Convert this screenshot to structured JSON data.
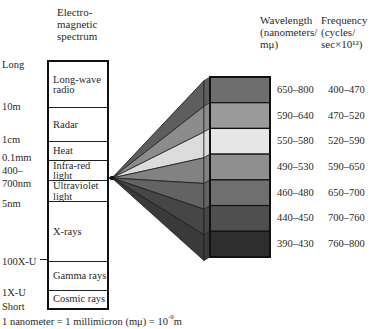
{
  "header": {
    "spectrum_title": [
      "Electro-",
      "magnetic",
      "spectrum"
    ],
    "wavelength_title": [
      "Wavelength",
      "(nanometers/",
      "mμ)"
    ],
    "frequency_title": [
      "Frequency",
      "(cycles/",
      "sec×10¹²)"
    ]
  },
  "scale_labels": [
    {
      "text": "Long",
      "y": 59
    },
    {
      "text": "10m",
      "y": 101
    },
    {
      "text": "1cm",
      "y": 134
    },
    {
      "text": "0.1mm",
      "y": 152
    },
    {
      "text": "400–",
      "y": 165
    },
    {
      "text": "700nm",
      "y": 178
    },
    {
      "text": "5nm",
      "y": 198
    },
    {
      "text": "100X-U",
      "y": 256
    },
    {
      "text": "1X-U",
      "y": 287
    },
    {
      "text": "Short",
      "y": 301
    }
  ],
  "spectrum_bands": [
    {
      "label": "Long-wave",
      "label2": "radio",
      "top": 0,
      "height": 46
    },
    {
      "label": "Radar",
      "label2": "",
      "top": 46,
      "height": 34
    },
    {
      "label": "Heat",
      "label2": "",
      "top": 80,
      "height": 19
    },
    {
      "label": "Infra-red",
      "label2": "light",
      "top": 99,
      "height": 20
    },
    {
      "label": "Ultraviolet",
      "label2": "light",
      "top": 119,
      "height": 21
    },
    {
      "label": "X-rays",
      "label2": "",
      "top": 140,
      "height": 60
    },
    {
      "label": "Gamma rays",
      "label2": "",
      "top": 200,
      "height": 29
    },
    {
      "label": "Cosmic rays",
      "label2": "",
      "top": 229,
      "height": 17
    }
  ],
  "visible_light_bands": [
    {
      "wavelength": "650–800",
      "frequency": "400–470",
      "color": "#6e6e6e",
      "fan_color": "#5e5e5e"
    },
    {
      "wavelength": "590–640",
      "frequency": "470–520",
      "color": "#9a9a9a",
      "fan_color": "#8c8c8c"
    },
    {
      "wavelength": "550–580",
      "frequency": "520–590",
      "color": "#e6e6e6",
      "fan_color": "#dcdcdc"
    },
    {
      "wavelength": "490–530",
      "frequency": "590–650",
      "color": "#8f8f8f",
      "fan_color": "#828282"
    },
    {
      "wavelength": "460–480",
      "frequency": "650–700",
      "color": "#6f6f6f",
      "fan_color": "#636363"
    },
    {
      "wavelength": "440–450",
      "frequency": "700–760",
      "color": "#4f4f4f",
      "fan_color": "#464646"
    },
    {
      "wavelength": "390–430",
      "frequency": "760–800",
      "color": "#2e2e2e",
      "fan_color": "#3a3a3a"
    }
  ],
  "footnote": "1 nanometer = 1 millimicron (mμ) = 10",
  "footnote_exp": "-9",
  "footnote_unit": "m"
}
